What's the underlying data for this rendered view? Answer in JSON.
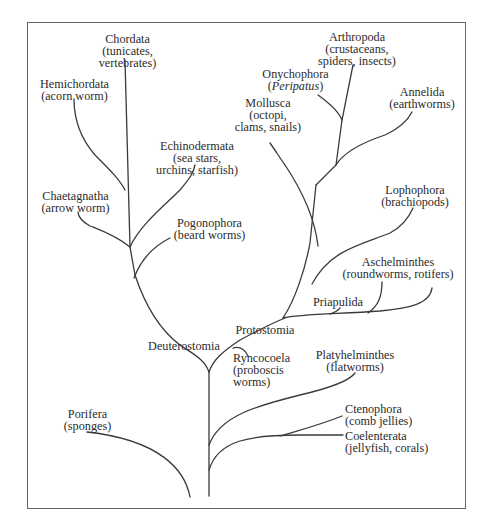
{
  "diagram": {
    "type": "phylogenetic-tree",
    "root": "Porifera/Metazoa base",
    "taxa": {
      "chordata": {
        "name": "Chordata",
        "common": "(tunicates,",
        "common2": "vertebrates)"
      },
      "hemichordata": {
        "name": "Hemichordata",
        "common": "(acorn worm)"
      },
      "echinodermata": {
        "name": "Echinodermata",
        "common": "(sea stars,",
        "common2": "urchins, starfish)"
      },
      "chaetagnatha": {
        "name": "Chaetagnatha",
        "common": "(arrow worm)"
      },
      "pogonophora": {
        "name": "Pogonophora",
        "common": "(beard worms)"
      },
      "deuterostomia": {
        "name": "Deuterostomia"
      },
      "protostomia": {
        "name": "Protostomia"
      },
      "arthropoda": {
        "name": "Arthropoda",
        "common": "(crustaceans,",
        "common2": "spiders, insects)"
      },
      "onychophora": {
        "name": "Onychophora",
        "common_open": "(",
        "common_italic": "Peripatus",
        "common_close": ")"
      },
      "mollusca": {
        "name": "Mollusca",
        "common": "(octopi,",
        "common2": "clams, snails)"
      },
      "annelida": {
        "name": "Annelida",
        "common": "(earthworms)"
      },
      "lophophora": {
        "name": "Lophophora",
        "common": "(brachiopods)"
      },
      "aschelminthes": {
        "name": "Aschelminthes",
        "common": "(roundworms, rotifers)"
      },
      "priapulida": {
        "name": "Priapulida"
      },
      "ryncocoela": {
        "name": "Ryncocoela",
        "common": "(proboscis",
        "common2": "worms)"
      },
      "platyhelminthes": {
        "name": "Platyhelminthes",
        "common": "(flatworms)"
      },
      "ctenophora": {
        "name": "Ctenophora",
        "common": "(comb jellies)"
      },
      "coelenterata": {
        "name": "Coelenterata",
        "common": "(jellyfish, corals)"
      },
      "porifera": {
        "name": "Porifera",
        "common": "(sponges)"
      }
    },
    "colors": {
      "line": "#3a3a3a",
      "frame": "#666666",
      "background": "#ffffff"
    }
  }
}
